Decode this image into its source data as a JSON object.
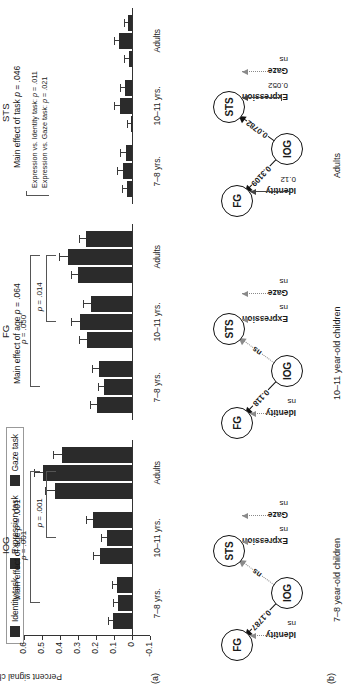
{
  "figure": {
    "panel_a_tag": "(a)",
    "panel_b_tag": "(b)"
  },
  "legend": {
    "items": [
      {
        "label": "Identity task",
        "color": "#2b2b2b"
      },
      {
        "label": "Expression task",
        "color": "#2b2b2b"
      },
      {
        "label": "Gaze task",
        "color": "#2b2b2b"
      }
    ]
  },
  "chart_data": {
    "type": "bar",
    "title": "",
    "ylabel": "Percent signal change",
    "xlabel": "",
    "ylim": [
      -0.1,
      0.6
    ],
    "yticks": [
      "0.6",
      "0.5",
      "0.4",
      "0.3",
      "0.2",
      "0.1",
      "0",
      "-0.1"
    ],
    "ytick_values": [
      0.6,
      0.5,
      0.4,
      0.3,
      0.2,
      0.1,
      0,
      -0.1
    ],
    "grid": false,
    "legend_position": "top-left",
    "categories": [
      "7–8 yrs.",
      "10–11 yrs.",
      "Adults"
    ],
    "series_names": [
      "Identity task",
      "Expression task",
      "Gaze task"
    ],
    "panels": [
      {
        "name": "IOG",
        "main_effect": "Main effect of age p = .001",
        "main_effect_prefix": "Main effect of age ",
        "main_effect_p": "p",
        "main_effect_suffix": " = .001",
        "series": [
          {
            "name": "Identity task",
            "values": [
              0.105,
              0.18,
              0.43
            ],
            "errors": [
              0.03,
              0.035,
              0.055
            ]
          },
          {
            "name": "Expression task",
            "values": [
              0.08,
              0.14,
              0.495
            ],
            "errors": [
              0.025,
              0.03,
              0.05
            ]
          },
          {
            "name": "Gaze task",
            "values": [
              0.085,
              0.215,
              0.39
            ],
            "errors": [
              0.028,
              0.04,
              0.048
            ]
          }
        ],
        "brackets": [
          {
            "label": "p = .001",
            "p_italic": "p",
            "p_rest": " = .001",
            "from": 0,
            "to": 2
          },
          {
            "label": "p = .001",
            "p_italic": "p",
            "p_rest": " = .001",
            "from": 1,
            "to": 2
          }
        ]
      },
      {
        "name": "FG",
        "main_effect": "Main effect of age p = .064",
        "main_effect_prefix": "Main effect of age ",
        "main_effect_p": "p",
        "main_effect_suffix": " = .064",
        "series": [
          {
            "name": "Identity task",
            "values": [
              0.195,
              0.25,
              0.3
            ],
            "errors": [
              0.04,
              0.045,
              0.04
            ]
          },
          {
            "name": "Expression task",
            "values": [
              0.155,
              0.29,
              0.355
            ],
            "errors": [
              0.035,
              0.05,
              0.048
            ]
          },
          {
            "name": "Gaze task",
            "values": [
              0.185,
              0.23,
              0.255
            ],
            "errors": [
              0.038,
              0.042,
              0.04
            ]
          }
        ],
        "brackets": [
          {
            "label": "p = .050",
            "p_italic": "p",
            "p_rest": " = .050",
            "from": 0,
            "to": 2
          },
          {
            "label": "p = .014",
            "p_italic": "p",
            "p_rest": " = .014",
            "from": 1,
            "to": 2
          }
        ]
      },
      {
        "name": "STS",
        "main_effect": "Main effect of task p = .046",
        "main_effect_prefix": "Main effect of task ",
        "main_effect_p": "p",
        "main_effect_suffix": " = .046",
        "series": [
          {
            "name": "Identity task",
            "values": [
              0.03,
              0.008,
              0.018
            ],
            "errors": [
              0.028,
              0.022,
              0.024
            ]
          },
          {
            "name": "Expression task",
            "values": [
              0.052,
              0.068,
              0.072
            ],
            "errors": [
              0.03,
              0.03,
              0.026
            ]
          },
          {
            "name": "Gaze task",
            "values": [
              0.035,
              0.04,
              0.022
            ],
            "errors": [
              0.03,
              0.028,
              0.022
            ]
          }
        ],
        "contrasts": [
          {
            "text": "Expression vs. Identity task: p = .011",
            "prefix": "Expression vs. Identity task: ",
            "p_italic": "p",
            "p_rest": " = .011"
          },
          {
            "text": "Expression vs. Gaze task: p = .021",
            "prefix": "Expression vs. Gaze task: ",
            "p_italic": "p",
            "p_rest": " = .021"
          }
        ],
        "brackets": []
      }
    ]
  },
  "diagrams": [
    {
      "caption": "7–8 year-old children",
      "nodes": [
        {
          "id": "FG",
          "label": "FG"
        },
        {
          "id": "STS",
          "label": "STS"
        },
        {
          "id": "IOG",
          "label": "IOG"
        }
      ],
      "edges": [
        {
          "from": "IOG",
          "to": "FG",
          "label": "0.1787",
          "significant": true
        },
        {
          "from": "IOG",
          "to": "STS",
          "label": "ns",
          "significant": false
        }
      ],
      "inputs": [
        {
          "node": "FG",
          "name": "Identity",
          "value": "ns",
          "significant": false
        },
        {
          "node": "STS",
          "name": "Expression",
          "value": "ns",
          "significant": false
        },
        {
          "node": "STS",
          "name": "Gaze",
          "value": "ns",
          "significant": false
        }
      ]
    },
    {
      "caption": "10–11 year-old children",
      "nodes": [
        {
          "id": "FG",
          "label": "FG"
        },
        {
          "id": "STS",
          "label": "STS"
        },
        {
          "id": "IOG",
          "label": "IOG"
        }
      ],
      "edges": [
        {
          "from": "IOG",
          "to": "FG",
          "label": "0.118",
          "significant": true
        },
        {
          "from": "IOG",
          "to": "STS",
          "label": "ns",
          "significant": false
        }
      ],
      "inputs": [
        {
          "node": "FG",
          "name": "Identity",
          "value": "ns",
          "significant": false
        },
        {
          "node": "STS",
          "name": "Expression",
          "value": "ns",
          "significant": false
        },
        {
          "node": "STS",
          "name": "Gaze",
          "value": "ns",
          "significant": false
        }
      ]
    },
    {
      "caption": "Adults",
      "nodes": [
        {
          "id": "FG",
          "label": "FG"
        },
        {
          "id": "STS",
          "label": "STS"
        },
        {
          "id": "IOG",
          "label": "IOG"
        }
      ],
      "edges": [
        {
          "from": "IOG",
          "to": "FG",
          "label": "0.3109",
          "significant": true
        },
        {
          "from": "IOG",
          "to": "STS",
          "label": "0.0782",
          "significant": true
        }
      ],
      "inputs": [
        {
          "node": "FG",
          "name": "Identity",
          "value": "0.12",
          "significant": true
        },
        {
          "node": "STS",
          "name": "Expression",
          "value": "0.052",
          "significant": true
        },
        {
          "node": "STS",
          "name": "Gaze",
          "value": "ns",
          "significant": false
        }
      ]
    }
  ]
}
